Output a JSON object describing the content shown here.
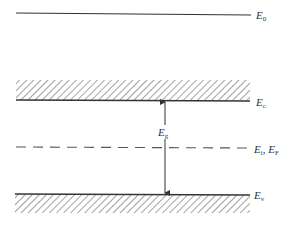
{
  "diagram": {
    "levels": [
      {
        "id": "E0",
        "symbol": "E",
        "subscript": "0",
        "style": "solid"
      },
      {
        "id": "Ec",
        "symbol": "E",
        "subscript": "c",
        "style": "solid-hatched-above"
      },
      {
        "id": "EiEF",
        "symbol": "E",
        "subscript": "i",
        "separator": ", ",
        "symbol2": "E",
        "subscript2": "F",
        "style": "dashed"
      },
      {
        "id": "Ev",
        "symbol": "E",
        "subscript": "v",
        "style": "solid-hatched-below"
      }
    ],
    "gap": {
      "symbol": "E",
      "subscript": "g",
      "arrow": "double-headed between Ec and Ev"
    },
    "colors": {
      "line": "#333333",
      "hatch": "#555555",
      "dash": "#555555"
    }
  }
}
